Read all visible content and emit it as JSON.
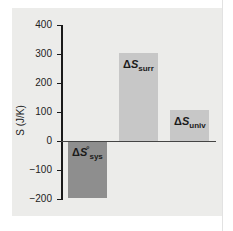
{
  "chart_data": {
    "type": "bar",
    "title": "",
    "xlabel": "",
    "ylabel": "S (J/K)",
    "ylim": [
      -200,
      400
    ],
    "yticks": [
      400,
      300,
      200,
      100,
      0,
      -100,
      -200
    ],
    "ytick_labels": [
      "400",
      "300",
      "200",
      "100",
      "0",
      "−100",
      "−200"
    ],
    "grid": false,
    "legend": null,
    "categories": [
      "ΔS°sys",
      "ΔSsurr",
      "ΔSuniv"
    ],
    "values": [
      -198,
      303,
      108
    ],
    "colors": [
      "#8e8e8e",
      "#c7c7c7",
      "#c7c7c7"
    ],
    "bar_labels": [
      {
        "delta": "Δ",
        "symbol": "S",
        "sup": "°",
        "sub": "sys"
      },
      {
        "delta": "Δ",
        "symbol": "S",
        "sup": "",
        "sub": "surr"
      },
      {
        "delta": "Δ",
        "symbol": "S",
        "sup": "",
        "sub": "univ"
      }
    ]
  }
}
